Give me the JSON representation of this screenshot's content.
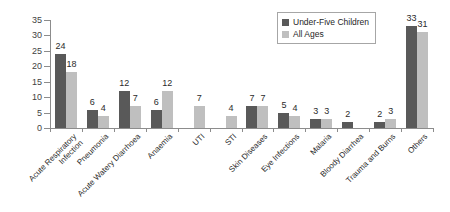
{
  "chart_data": {
    "type": "bar",
    "title": "",
    "subtitle": "",
    "xlabel": "",
    "ylabel": "",
    "ylim": [
      0,
      35
    ],
    "yticks": [
      0,
      5,
      10,
      15,
      20,
      25,
      30,
      35
    ],
    "grid": false,
    "legend_position": "top-right",
    "categories": [
      "Acute Respiratory Infection",
      "Pneumonia",
      "Acute Watery Diarrhoea",
      "Anaemia",
      "UTI",
      "STI",
      "Skin Diseases",
      "Eye Infections",
      "Malaria",
      "Bloody Diarrhea",
      "Trauma and Burns",
      "Others"
    ],
    "category_lines": [
      [
        "Acute Respiratory",
        "Infection"
      ],
      [
        "Pneumonia"
      ],
      [
        "Acute Watery Diarrhoea"
      ],
      [
        "Anaemia"
      ],
      [
        "UTI"
      ],
      [
        "STI"
      ],
      [
        "Skin Diseases"
      ],
      [
        "Eye Infections"
      ],
      [
        "Malaria"
      ],
      [
        "Bloody Diarrhea"
      ],
      [
        "Trauma and Burns"
      ],
      [
        "Others"
      ]
    ],
    "series": [
      {
        "name": "Under-Five Children",
        "color": "#595959",
        "values": [
          24,
          6,
          12,
          6,
          null,
          null,
          7,
          5,
          3,
          2,
          2,
          33
        ]
      },
      {
        "name": "All Ages",
        "color": "#bfbfbf",
        "values": [
          18,
          4,
          7,
          12,
          7,
          4,
          7,
          4,
          3,
          null,
          3,
          31
        ]
      }
    ]
  },
  "legend": {
    "items": [
      {
        "label": "Under-Five Children",
        "swatch": "under-five"
      },
      {
        "label": "All Ages",
        "swatch": "all-ages"
      }
    ]
  },
  "colors": {
    "under_five": "#595959",
    "all_ages": "#bfbfbf",
    "axis": "#8c8c8c",
    "text": "#2b2b2b",
    "background": "#ffffff"
  }
}
